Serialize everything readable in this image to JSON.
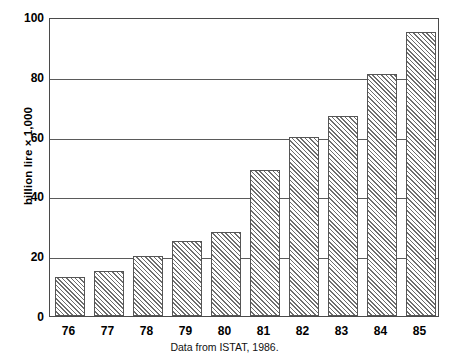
{
  "figure": {
    "page_header_fragment": "",
    "page_number_fragment": ""
  },
  "chart_data": {
    "type": "bar",
    "title": "",
    "subtitle": "",
    "caption": "Data from ISTAT, 1986.",
    "xlabel": "",
    "ylabel": "billion lire × 1,000",
    "categories": [
      "76",
      "77",
      "78",
      "79",
      "80",
      "81",
      "82",
      "83",
      "84",
      "85"
    ],
    "values": [
      13,
      15,
      20,
      25,
      28,
      49,
      60,
      67,
      81,
      95
    ],
    "ylim": [
      0,
      100
    ],
    "yticks": [
      0,
      20,
      40,
      60,
      80,
      100
    ],
    "ytick_labels": [
      "0",
      "20",
      "40",
      "60",
      "80",
      "100"
    ],
    "grid": "horizontal",
    "legend": "none",
    "bar_fill": "diagonal-hatch",
    "bar_edge_color": "#555555",
    "grid_color": "#5a5a5a",
    "background_color": "#ffffff",
    "text_color": "#000000"
  }
}
